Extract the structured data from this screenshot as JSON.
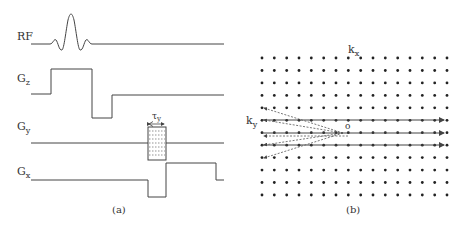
{
  "panel_a": {
    "caption": "(a)",
    "labels": {
      "rf": "RF",
      "gz_main": "G",
      "gz_sub": "z",
      "gy_main": "G",
      "gy_sub": "y",
      "gx_main": "G",
      "gx_sub": "x",
      "tau_main": "τ",
      "tau_sub": "y"
    }
  },
  "panel_b": {
    "caption": "(b)",
    "labels": {
      "kx_main": "k",
      "kx_sub": "x",
      "ky_main": "k",
      "ky_sub": "y",
      "origin": "o"
    },
    "grid": {
      "columns": 16,
      "rows": 12
    }
  },
  "colors": {
    "line": "#444444",
    "dot": "#222222",
    "text": "#333333"
  }
}
